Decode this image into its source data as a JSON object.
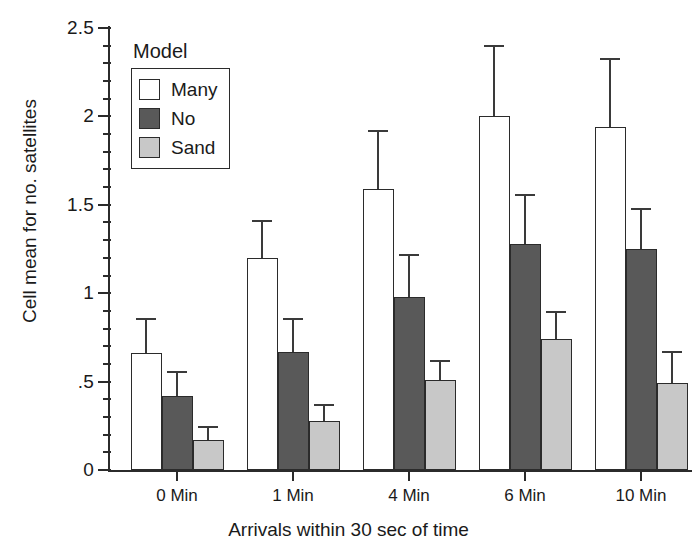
{
  "chart_data": {
    "type": "bar",
    "title": "",
    "xlabel": "Arrivals within 30 sec of time",
    "ylabel": "Cell mean for no. satellites",
    "categories": [
      "0 Min",
      "1 Min",
      "4 Min",
      "6 Min",
      "10 Min"
    ],
    "ylim": [
      0,
      2.5
    ],
    "ytick_labels": [
      "0",
      ".5",
      "1",
      "1.5",
      "2",
      "2.5"
    ],
    "ytick_values": [
      0,
      0.5,
      1,
      1.5,
      2,
      2.5
    ],
    "minor_tick_step": 0.1,
    "grid": false,
    "legend_title": "Model",
    "legend_position": "upper-left-inside",
    "error_bars": "upper-only",
    "series": [
      {
        "name": "Many",
        "color": "#ffffff",
        "values": [
          0.66,
          1.2,
          1.59,
          2.0,
          1.94
        ],
        "errors": [
          0.19,
          0.2,
          0.32,
          0.39,
          0.38
        ]
      },
      {
        "name": "No",
        "color": "#595959",
        "values": [
          0.42,
          0.67,
          0.98,
          1.28,
          1.25
        ],
        "errors": [
          0.13,
          0.18,
          0.23,
          0.27,
          0.22
        ]
      },
      {
        "name": "Sand",
        "color": "#c8c8c8",
        "values": [
          0.17,
          0.28,
          0.51,
          0.74,
          0.49
        ],
        "errors": [
          0.07,
          0.08,
          0.1,
          0.15,
          0.17
        ]
      }
    ]
  }
}
